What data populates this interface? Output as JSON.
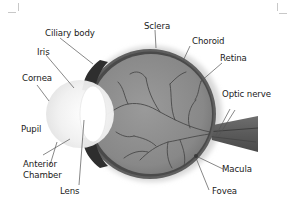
{
  "diagram": {
    "labels": {
      "ciliary_body": "Ciliary body",
      "sclera": "Sclera",
      "choroid": "Choroid",
      "iris": "Iris",
      "retina": "Retina",
      "cornea": "Cornea",
      "optic_nerve": "Optic nerve",
      "pupil": "Pupil",
      "anterior_chamber_line1": "Anterior",
      "anterior_chamber_line2": "Chamber",
      "macula": "Macula",
      "lens": "Lens",
      "fovea": "Fovea"
    },
    "colors": {
      "eyeball_interior": "#8c8c8c",
      "sclera_rim": "#5a5a5a",
      "choroid_dark": "#3a3a3a",
      "vessels": "#4a4a4a",
      "cornea": "#f2f2f2",
      "lens": "#ffffff",
      "leader_lines": "#555555",
      "text": "#1a1a1a",
      "background": "#ffffff"
    }
  }
}
